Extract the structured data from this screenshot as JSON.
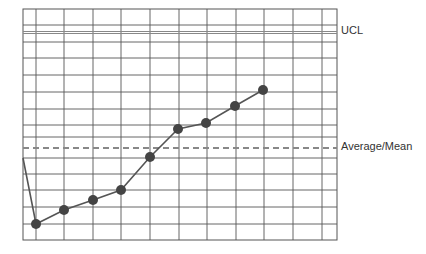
{
  "chart_data": {
    "type": "line",
    "title": "",
    "xlabel": "",
    "ylabel": "",
    "grid": true,
    "annotations": [
      {
        "label": "UCL",
        "kind": "solid-double-line",
        "y_px": 32.5
      },
      {
        "label": "Average/Mean",
        "kind": "dashed-line",
        "y_px": 148
      }
    ],
    "series": [
      {
        "name": "process",
        "points_px": [
          [
            23,
            158
          ],
          [
            36,
            224
          ],
          [
            64,
            210
          ],
          [
            93,
            200
          ],
          [
            121,
            190
          ],
          [
            150,
            157
          ],
          [
            178,
            129
          ],
          [
            206,
            123
          ],
          [
            235,
            106
          ],
          [
            263,
            90
          ]
        ]
      }
    ],
    "grid_px": {
      "left": 23,
      "right": 337,
      "top": 9,
      "bottom": 240,
      "vlines": [
        36,
        64,
        93,
        121,
        150,
        179,
        207,
        236,
        264,
        293,
        322
      ],
      "hlines": [
        25,
        42,
        58,
        75,
        92,
        109,
        125,
        137,
        158,
        174,
        190,
        207,
        224
      ]
    }
  },
  "labels": {
    "ucl": "UCL",
    "mean": "Average/Mean"
  },
  "colors": {
    "grid": "#555555",
    "ucl": "#888888",
    "mean": "#888888",
    "line": "#555555",
    "marker": "#444444"
  }
}
